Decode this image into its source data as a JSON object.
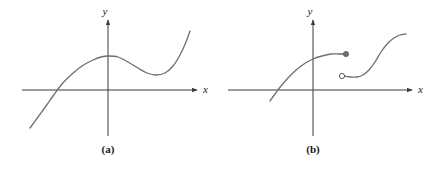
{
  "figure": {
    "background_color": "#ffffff",
    "axis_color": "#3a3a3a",
    "curve_color": "#6e6e6e",
    "label_color": "#1a1a1a",
    "panels": [
      {
        "id": "a",
        "caption": "(a)",
        "x_axis_label": "x",
        "y_axis_label": "y"
      },
      {
        "id": "b",
        "caption": "(b)",
        "x_axis_label": "x",
        "y_axis_label": "y"
      }
    ]
  },
  "chart_data": [
    {
      "type": "line",
      "title": "(a)",
      "xlabel": "x",
      "ylabel": "y",
      "grid": false,
      "legend": null,
      "axes": {
        "origin_px": [
          108,
          90
        ],
        "x_axis_y_px": 90,
        "y_axis_x_px": 108,
        "x_arrow_end_px": 197,
        "y_arrow_end_px": 20,
        "x_axis_start_px": 22,
        "y_axis_end_px": 136
      },
      "description": "Single smooth continuous cubic-like curve: rises from lower left, crosses the x-axis, reaches a local maximum on the y-axis, dips to a local minimum, then rises again.",
      "series": [
        {
          "name": "continuous-curve",
          "continuous": true,
          "points_px": [
            [
              30,
              128
            ],
            [
              38,
              117
            ],
            [
              46,
              106
            ],
            [
              53,
              96
            ],
            [
              62,
              84
            ],
            [
              72,
              74
            ],
            [
              82,
              66
            ],
            [
              93,
              60
            ],
            [
              101,
              57
            ],
            [
              108,
              56
            ],
            [
              118,
              57
            ],
            [
              128,
              62
            ],
            [
              138,
              68
            ],
            [
              147,
              73
            ],
            [
              156,
              75
            ],
            [
              165,
              73
            ],
            [
              173,
              66
            ],
            [
              180,
              55
            ],
            [
              186,
              42
            ],
            [
              190,
              31
            ]
          ],
          "features": {
            "x_intercept_px": [
              53,
              90
            ],
            "local_max_px": [
              108,
              56
            ],
            "local_min_px": [
              156,
              75
            ]
          }
        }
      ]
    },
    {
      "type": "line",
      "title": "(b)",
      "xlabel": "x",
      "ylabel": "y",
      "grid": false,
      "legend": null,
      "axes": {
        "origin_px": [
          313,
          90
        ],
        "x_axis_y_px": 90,
        "y_axis_x_px": 313,
        "x_arrow_end_px": 412,
        "y_arrow_end_px": 20,
        "x_axis_start_px": 228,
        "y_axis_end_px": 136
      },
      "description": "Two curve branches with a jump discontinuity. The left branch is concave down and ends at a filled (closed) endpoint; the right branch begins at an open (hollow) endpoint below it and rises in an S shape.",
      "series": [
        {
          "name": "left-branch",
          "continuous": true,
          "points_px": [
            [
              270,
              101
            ],
            [
              275,
              94
            ],
            [
              281,
              86
            ],
            [
              288,
              78
            ],
            [
              296,
              70
            ],
            [
              304,
              64
            ],
            [
              313,
              59
            ],
            [
              322,
              56
            ],
            [
              331,
              54
            ],
            [
              339,
              54
            ],
            [
              345,
              54
            ]
          ],
          "endpoint": {
            "type": "closed-dot",
            "filled": true,
            "px": [
              346,
              54
            ],
            "radius_px": 2.6
          }
        },
        {
          "name": "right-branch",
          "continuous": true,
          "points_px": [
            [
              343,
              76
            ],
            [
              350,
              77
            ],
            [
              357,
              77
            ],
            [
              363,
              75
            ],
            [
              369,
              70
            ],
            [
              375,
              62
            ],
            [
              381,
              52
            ],
            [
              388,
              43
            ],
            [
              394,
              38
            ],
            [
              400,
              35
            ],
            [
              406,
              34
            ]
          ],
          "endpoint": {
            "type": "open-circle",
            "filled": false,
            "px": [
              342,
              76
            ],
            "radius_px": 2.6
          }
        }
      ]
    }
  ]
}
